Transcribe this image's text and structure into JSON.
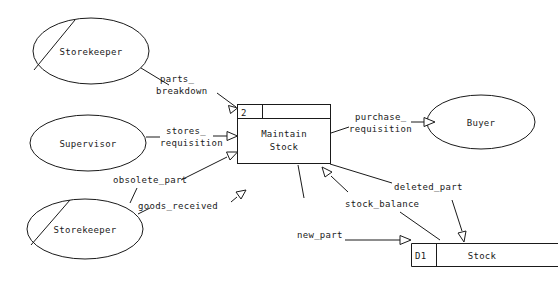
{
  "diagram": {
    "type": "data-flow-diagram",
    "colors": {
      "stroke": "#1a1a1a",
      "background": "#ffffff",
      "fill": "#ffffff"
    }
  },
  "entities": [
    {
      "id": "storekeeper-top",
      "label": "Storekeeper",
      "duplicate_marker": true
    },
    {
      "id": "supervisor",
      "label": "Supervisor",
      "duplicate_marker": false
    },
    {
      "id": "storekeeper-bottom",
      "label": "Storekeeper",
      "duplicate_marker": true
    },
    {
      "id": "buyer",
      "label": "Buyer",
      "duplicate_marker": false
    }
  ],
  "process": {
    "id": "process-2",
    "number": "2",
    "name_line1": "Maintain",
    "name_line2": "Stock",
    "location": ""
  },
  "datastore": {
    "id": "datastore-d1",
    "code": "D1",
    "name": "Stock"
  },
  "flows": [
    {
      "id": "parts-breakdown",
      "line1": "parts_",
      "line2": "breakdown",
      "from": "storekeeper-top",
      "to": "process-2"
    },
    {
      "id": "stores-requisition",
      "line1": "stores_",
      "line2": "requisition",
      "from": "supervisor",
      "to": "process-2"
    },
    {
      "id": "obsolete-part",
      "line1": "obsolete_part",
      "line2": "",
      "from": "storekeeper-bottom",
      "to": "process-2"
    },
    {
      "id": "goods-received",
      "line1": "goods_received",
      "line2": "",
      "from": "storekeeper-bottom",
      "to": "process-2"
    },
    {
      "id": "purchase-requisition",
      "line1": "purchase_",
      "line2": "requisition",
      "from": "process-2",
      "to": "buyer"
    },
    {
      "id": "deleted-part",
      "line1": "deleted_part",
      "line2": "",
      "from": "process-2",
      "to": "datastore-d1"
    },
    {
      "id": "stock-balance",
      "line1": "stock_balance",
      "line2": "",
      "from": "datastore-d1",
      "to": "process-2"
    },
    {
      "id": "new-part",
      "line1": "new_part",
      "line2": "",
      "from": "process-2",
      "to": "datastore-d1"
    }
  ]
}
